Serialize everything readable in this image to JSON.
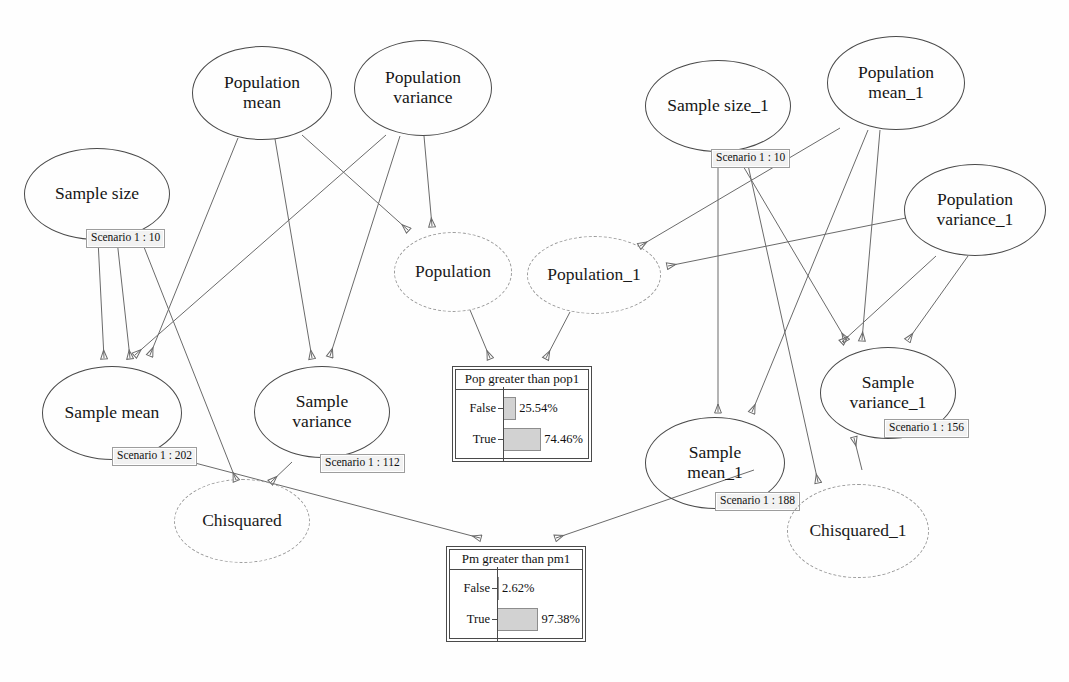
{
  "diagram": {
    "type": "influence-diagram",
    "nodes": [
      {
        "id": "sample_size",
        "label": "Sample size",
        "shape": "ellipse-solid",
        "x": 24,
        "y": 148,
        "w": 146,
        "h": 92,
        "scenario": "Scenario 1 : 10",
        "scenario_x": 86,
        "scenario_y": 229
      },
      {
        "id": "population_mean",
        "label": "Population\nmean",
        "shape": "ellipse-solid",
        "x": 192,
        "y": 46,
        "w": 140,
        "h": 94
      },
      {
        "id": "population_variance",
        "label": "Population\nvariance",
        "shape": "ellipse-solid",
        "x": 354,
        "y": 40,
        "w": 138,
        "h": 96
      },
      {
        "id": "population",
        "label": "Population",
        "shape": "ellipse-dashed",
        "x": 394,
        "y": 232,
        "w": 118,
        "h": 80
      },
      {
        "id": "population_1",
        "label": "Population_1",
        "shape": "ellipse-dashed",
        "x": 527,
        "y": 236,
        "w": 134,
        "h": 78
      },
      {
        "id": "sample_mean",
        "label": "Sample mean",
        "shape": "ellipse-solid",
        "x": 42,
        "y": 366,
        "w": 140,
        "h": 94,
        "scenario": "Scenario 1 : 202",
        "scenario_x": 112,
        "scenario_y": 447
      },
      {
        "id": "sample_variance",
        "label": "Sample\nvariance",
        "shape": "ellipse-solid",
        "x": 254,
        "y": 366,
        "w": 136,
        "h": 92,
        "scenario": "Scenario 1 : 112",
        "scenario_x": 320,
        "scenario_y": 454
      },
      {
        "id": "chisquared",
        "label": "Chisquared",
        "shape": "ellipse-dashed",
        "x": 174,
        "y": 479,
        "w": 136,
        "h": 84
      },
      {
        "id": "sample_size_1",
        "label": "Sample size_1",
        "shape": "ellipse-solid",
        "x": 645,
        "y": 60,
        "w": 146,
        "h": 92,
        "scenario": "Scenario 1 : 10",
        "scenario_x": 711,
        "scenario_y": 149
      },
      {
        "id": "population_mean_1",
        "label": "Population\nmean_1",
        "shape": "ellipse-solid",
        "x": 827,
        "y": 36,
        "w": 138,
        "h": 94
      },
      {
        "id": "population_variance_1",
        "label": "Population\nvariance_1",
        "shape": "ellipse-solid",
        "x": 904,
        "y": 164,
        "w": 142,
        "h": 92
      },
      {
        "id": "sample_mean_1",
        "label": "Sample\nmean_1",
        "shape": "ellipse-solid",
        "x": 645,
        "y": 417,
        "w": 140,
        "h": 92,
        "scenario": "Scenario 1 : 188",
        "scenario_x": 715,
        "scenario_y": 492
      },
      {
        "id": "sample_variance_1",
        "label": "Sample\nvariance_1",
        "shape": "ellipse-solid",
        "x": 820,
        "y": 347,
        "w": 136,
        "h": 92,
        "scenario": "Scenario 1 : 156",
        "scenario_x": 884,
        "scenario_y": 419
      },
      {
        "id": "chisquared_1",
        "label": "Chisquared_1",
        "shape": "ellipse-dashed",
        "x": 787,
        "y": 484,
        "w": 142,
        "h": 94
      }
    ],
    "edges": [
      {
        "from": "sample_size",
        "to": "sample_mean"
      },
      {
        "from": "sample_size",
        "to": "sample_variance"
      },
      {
        "from": "sample_size",
        "to": "chisquared"
      },
      {
        "from": "population_mean",
        "to": "sample_mean"
      },
      {
        "from": "population_mean",
        "to": "sample_variance"
      },
      {
        "from": "population_mean",
        "to": "population"
      },
      {
        "from": "population_variance",
        "to": "population"
      },
      {
        "from": "population_variance",
        "to": "sample_mean"
      },
      {
        "from": "population_variance",
        "to": "sample_variance"
      },
      {
        "from": "sample_variance",
        "to": "chisquared"
      },
      {
        "from": "population",
        "to": "pop_greater_than_pop1"
      },
      {
        "from": "population_1",
        "to": "pop_greater_than_pop1"
      },
      {
        "from": "sample_mean",
        "to": "pm_greater_than_pm1"
      },
      {
        "from": "sample_mean_1",
        "to": "pm_greater_than_pm1"
      },
      {
        "from": "sample_size_1",
        "to": "sample_mean_1"
      },
      {
        "from": "sample_size_1",
        "to": "sample_variance_1"
      },
      {
        "from": "sample_size_1",
        "to": "chisquared_1"
      },
      {
        "from": "population_mean_1",
        "to": "population_1"
      },
      {
        "from": "population_mean_1",
        "to": "sample_mean_1"
      },
      {
        "from": "population_mean_1",
        "to": "sample_variance_1"
      },
      {
        "from": "population_variance_1",
        "to": "population_1"
      },
      {
        "from": "population_variance_1",
        "to": "sample_mean_1"
      },
      {
        "from": "population_variance_1",
        "to": "sample_variance_1"
      },
      {
        "from": "sample_variance_1",
        "to": "chisquared_1"
      }
    ],
    "monitors": [
      {
        "id": "pop_greater_than_pop1",
        "title": "Pop greater than pop1",
        "x": 452,
        "y": 366,
        "w": 140,
        "h": 96,
        "chart_data": {
          "type": "bar",
          "title": "Pop greater than pop1",
          "orientation": "horizontal",
          "categories": [
            "False",
            "True"
          ],
          "values": [
            25.54,
            74.46
          ],
          "value_labels": [
            "25.54%",
            "74.46%"
          ],
          "xlim": [
            0,
            100
          ],
          "grid": false,
          "legend": "none"
        }
      },
      {
        "id": "pm_greater_than_pm1",
        "title": "Pm greater than pm1",
        "x": 446,
        "y": 546,
        "w": 140,
        "h": 96,
        "chart_data": {
          "type": "bar",
          "title": "Pm greater than pm1",
          "orientation": "horizontal",
          "categories": [
            "False",
            "True"
          ],
          "values": [
            2.62,
            97.38
          ],
          "value_labels": [
            "2.62%",
            "97.38%"
          ],
          "xlim": [
            0,
            100
          ],
          "grid": false,
          "legend": "none"
        }
      }
    ],
    "colors": {
      "node_stroke": "#4a4a4a",
      "dashed_stroke": "#9a9a9a",
      "edge_stroke": "#6a6a6a",
      "bar_fill": "#d2d2d2",
      "scenario_bg": "#f2f2f2",
      "background": "#ffffff"
    }
  }
}
